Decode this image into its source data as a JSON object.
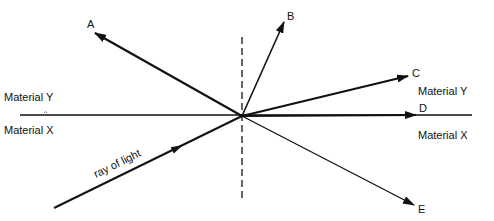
{
  "diagram": {
    "type": "refraction-reflection",
    "origin": {
      "x": 242,
      "y": 116
    },
    "colors": {
      "ink": "#111111",
      "background": "#ffffff",
      "dashed": "#333333"
    },
    "boundary": {
      "x1": 20,
      "y1": 115,
      "x2": 472,
      "y2": 115
    },
    "normal": {
      "x": 242,
      "y1": 37,
      "y2": 198,
      "style": "dashed"
    },
    "materials": {
      "top_left": "Material Y",
      "bottom_left": "Material X",
      "top_right": "Material Y",
      "bottom_right": "Material X"
    },
    "incident_ray": {
      "label": "ray of light",
      "start": {
        "x": 54,
        "y": 208
      },
      "end": {
        "x": 242,
        "y": 116
      },
      "arrow_at": {
        "x": 183,
        "y": 145
      }
    },
    "rays": [
      {
        "label": "A",
        "tip": {
          "x": 95,
          "y": 33
        },
        "label_pos": {
          "x": 87,
          "y": 28
        },
        "weight": 2.2
      },
      {
        "label": "B",
        "tip": {
          "x": 284,
          "y": 22
        },
        "label_pos": {
          "x": 287,
          "y": 20
        },
        "weight": 1.6
      },
      {
        "label": "C",
        "tip": {
          "x": 408,
          "y": 76
        },
        "label_pos": {
          "x": 412,
          "y": 77
        },
        "weight": 2.2
      },
      {
        "label": "D",
        "tip": {
          "x": 416,
          "y": 115
        },
        "label_pos": {
          "x": 419,
          "y": 112
        },
        "weight": 2.2
      },
      {
        "label": "E",
        "tip": {
          "x": 414,
          "y": 205
        },
        "label_pos": {
          "x": 418,
          "y": 213
        },
        "weight": 1.3
      }
    ]
  }
}
